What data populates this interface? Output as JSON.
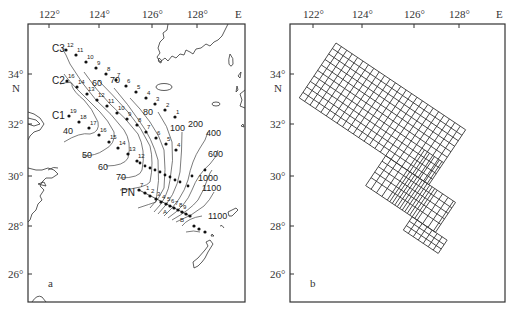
{
  "figure": {
    "panels": [
      {
        "id": "a",
        "panel_label": "a",
        "x_ticks": [
          "122°",
          "124°",
          "126°",
          "128°"
        ],
        "x_unit": "E",
        "y_ticks": [
          "34°",
          "32°",
          "30°",
          "28°",
          "26°"
        ],
        "y_unit": "N",
        "sections": [
          "C3",
          "C2",
          "C1",
          "PN"
        ],
        "contour_labels": [
          "40",
          "50",
          "60",
          "60",
          "70",
          "70",
          "80",
          "100",
          "200",
          "400",
          "600",
          "1000",
          "1100",
          "1100"
        ],
        "station_labels": {
          "C3": [
            "12",
            "11",
            "10",
            "9",
            "8",
            "7",
            "6",
            "5",
            "4",
            "3",
            "2",
            "1"
          ],
          "C2": [
            "16",
            "14",
            "13",
            "12",
            "11",
            "10",
            "9",
            "8",
            "7",
            "6",
            "5",
            "4"
          ],
          "C1": [
            "19",
            "18",
            "17",
            "16",
            "15",
            "14",
            "13",
            "12"
          ],
          "PN": [
            "7",
            "1",
            "2",
            "3",
            "4",
            "5",
            "6",
            "7",
            "8",
            "9",
            "A",
            "B"
          ]
        }
      },
      {
        "id": "b",
        "panel_label": "b",
        "x_ticks": [
          "122°",
          "124°",
          "126°",
          "128°"
        ],
        "x_unit": "E",
        "y_ticks": [
          "34°",
          "32°",
          "30°",
          "28°",
          "26°"
        ],
        "y_unit": "N",
        "description": "Rotated computational grid over East China Sea shelf, refined near shelf break"
      }
    ]
  }
}
